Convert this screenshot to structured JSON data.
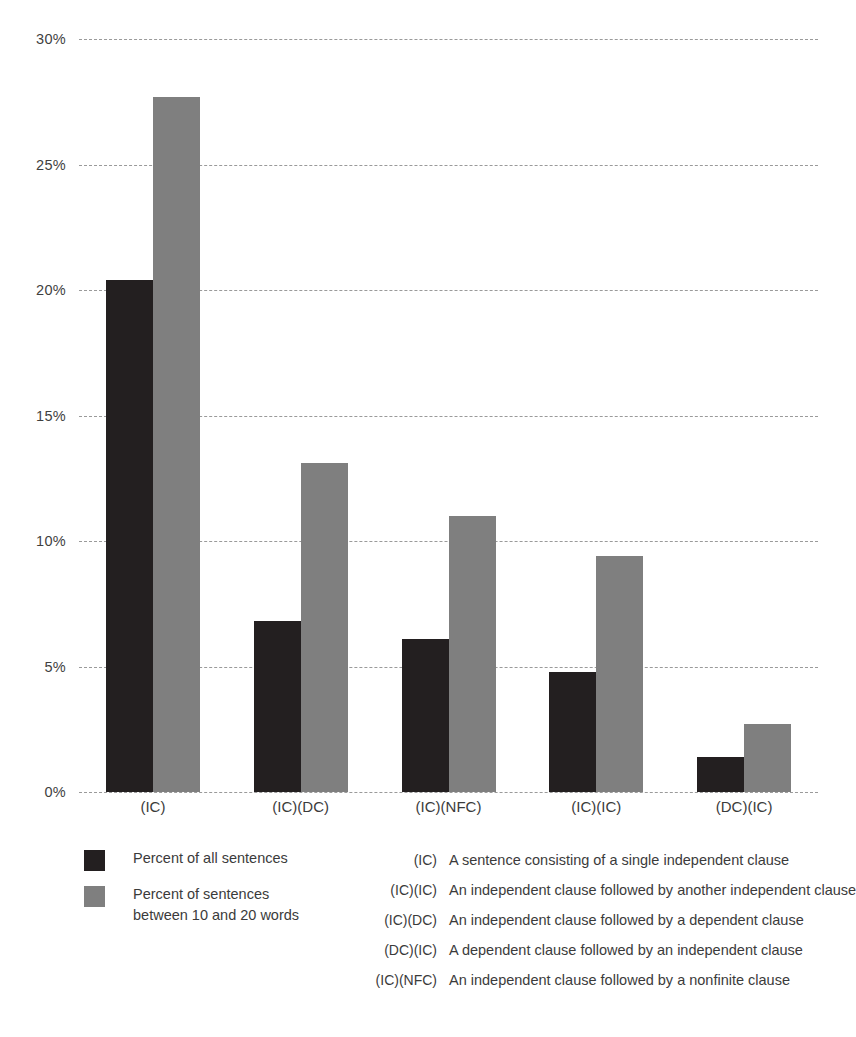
{
  "chart_data": {
    "type": "bar",
    "title": "",
    "subtitle": "",
    "xlabel": "",
    "ylabel": "",
    "ylim": [
      0,
      30
    ],
    "ytick_labels": [
      "30%",
      "25%",
      "20%",
      "15%",
      "10%",
      "5%",
      "0%"
    ],
    "ytick_values": [
      30,
      25,
      20,
      15,
      10,
      5,
      0
    ],
    "grid": true,
    "grid_style": "dashed-horizontal",
    "legend_position": "below-left",
    "categories": [
      "(IC)",
      "(IC)(DC)",
      "(IC)(NFC)",
      "(IC)(IC)",
      "(DC)(IC)"
    ],
    "series": [
      {
        "name": "Percent of all sentences",
        "color": "#231f20",
        "values": [
          20.4,
          6.8,
          6.1,
          4.8,
          1.4
        ]
      },
      {
        "name": "Percent of sentences between 10 and 20 words",
        "color": "#7f7f7f",
        "values": [
          27.7,
          13.1,
          11.0,
          9.4,
          2.7
        ]
      }
    ]
  },
  "legend": {
    "items": [
      {
        "label": "Percent of all sentences",
        "swatch": "#231f20"
      },
      {
        "label": "Percent of sentences\nbetween 10 and 20 words",
        "swatch": "#7f7f7f"
      }
    ]
  },
  "key": {
    "rows": [
      {
        "code": "(IC)",
        "description": "A sentence consisting of a single independent clause"
      },
      {
        "code": "(IC)(IC)",
        "description": "An independent clause followed by another independent clause"
      },
      {
        "code": "(IC)(DC)",
        "description": "An independent clause followed by a dependent clause"
      },
      {
        "code": "(DC)(IC)",
        "description": "A dependent clause followed by an independent clause"
      },
      {
        "code": "(IC)(NFC)",
        "description": "An independent clause followed by a nonfinite clause"
      }
    ]
  }
}
